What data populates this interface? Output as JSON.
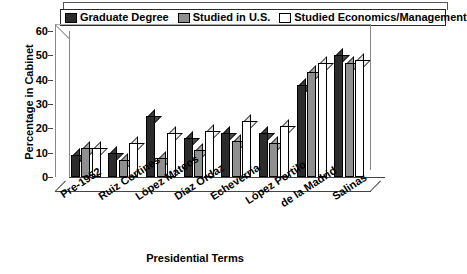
{
  "chart_data": {
    "type": "bar",
    "title": "",
    "xlabel": "Presidential Terms",
    "ylabel": "Percentage in Cabinet",
    "ylim": [
      0,
      60
    ],
    "yticks": [
      0,
      10,
      20,
      30,
      40,
      50,
      60
    ],
    "grid": false,
    "legend_position": "top",
    "three_d": true,
    "categories": [
      "Pre-1952",
      "Ruiz Cortines",
      "López Mateos",
      "Díaz Ordaz",
      "Echeverría",
      "López Portilo",
      "de la Madrid",
      "Salinas"
    ],
    "series": [
      {
        "name": "Graduate Degree",
        "color": "#2b2b2b",
        "values": [
          9,
          10,
          25,
          16,
          18,
          18,
          38,
          50
        ]
      },
      {
        "name": "Studied in U.S.",
        "color": "#8f8f8f",
        "values": [
          12,
          7,
          8,
          11,
          15,
          14,
          43,
          47
        ]
      },
      {
        "name": "Studied Economics/Management",
        "color": "#ffffff",
        "values": [
          12,
          14,
          18,
          19,
          23,
          21,
          47,
          48
        ]
      }
    ]
  },
  "legend": {
    "items": [
      {
        "label": "Graduate Degree",
        "swatch": "dark-swatch-icon"
      },
      {
        "label": "Studied in U.S.",
        "swatch": "gray-swatch-icon"
      },
      {
        "label": "Studied Economics/Management",
        "swatch": "white-swatch-icon"
      }
    ]
  },
  "axes": {
    "y_title": "Percentage in Cabinet",
    "x_title": "Presidential Terms",
    "y_ticks": [
      "60",
      "50",
      "40",
      "30",
      "20",
      "10",
      "0"
    ]
  }
}
